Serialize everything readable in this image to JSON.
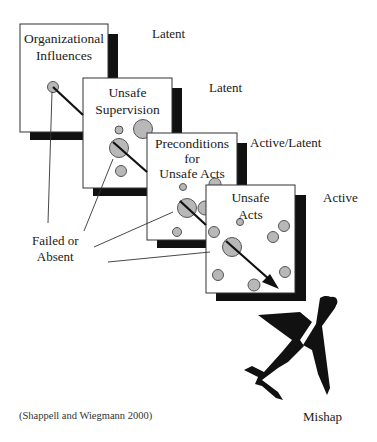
{
  "diagram": {
    "layers": [
      {
        "id": "organizational",
        "title_lines": [
          "Organizational",
          "Influences"
        ],
        "level": "Latent"
      },
      {
        "id": "supervision",
        "title_lines": [
          "Unsafe",
          "Supervision"
        ],
        "level": "Latent"
      },
      {
        "id": "preconditions",
        "title_lines": [
          "Preconditions",
          "for",
          "Unsafe Acts"
        ],
        "level": "Active/Latent"
      },
      {
        "id": "unsafe-acts",
        "title_lines": [
          "Unsafe",
          "Acts"
        ],
        "level": "Active"
      }
    ],
    "callout_label_lines": [
      "Failed or",
      "Absent"
    ],
    "outcome_label": "Mishap",
    "citation": "(Shappell and Wiegmann 2000)",
    "colors": {
      "hole_fill": "#b8b8b8",
      "hole_stroke": "#555555",
      "shadow": "#111111",
      "box_stroke": "#333333",
      "arrow": "#111111",
      "plane": "#111111"
    }
  }
}
